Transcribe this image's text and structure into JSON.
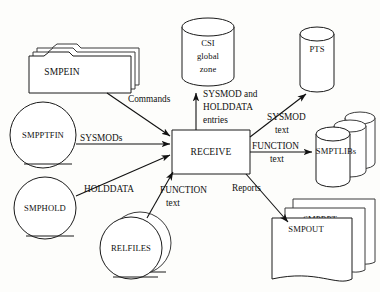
{
  "diagram": {
    "type": "data-flow",
    "process": {
      "id": "receive",
      "label": "RECEIVE",
      "shape": "process-box"
    },
    "inputs": [
      {
        "id": "smpein",
        "label": "SMPEIN",
        "shape": "folder-stack",
        "count": 3
      },
      {
        "id": "smpptfin",
        "label": "SMPPTFIN",
        "shape": "tape-reel",
        "count": 1
      },
      {
        "id": "smphold",
        "label": "SMPHOLD",
        "shape": "tape-reel",
        "count": 1
      },
      {
        "id": "relfiles",
        "label": "RELFILES",
        "shape": "tape-reel",
        "count": 2
      }
    ],
    "outputs": [
      {
        "id": "csi",
        "label_lines": [
          "CSI",
          "global",
          "zone"
        ],
        "shape": "cylinder",
        "count": 1
      },
      {
        "id": "pts",
        "label_lines": [
          "PTS"
        ],
        "shape": "cylinder",
        "count": 1
      },
      {
        "id": "smptlibs",
        "label_lines": [
          "SMPTLIBs"
        ],
        "shape": "cylinder-stack",
        "count": 3
      },
      {
        "id": "reports",
        "label_lines": [
          "SMPRPT",
          "SMPOUT"
        ],
        "shape": "document-stack",
        "count": 3
      }
    ],
    "edges": [
      {
        "id": "e-smpein-receive",
        "from": "smpein",
        "to": "receive",
        "label_lines": [
          "Commands"
        ]
      },
      {
        "id": "e-smpptfin-receive",
        "from": "smpptfin",
        "to": "receive",
        "label_lines": [
          "SYSMODs"
        ]
      },
      {
        "id": "e-smphold-receive",
        "from": "smphold",
        "to": "receive",
        "label_lines": [
          "HOLDDATA"
        ]
      },
      {
        "id": "e-relfiles-receive",
        "from": "relfiles",
        "to": "receive",
        "label_lines": [
          "FUNCTION",
          "text"
        ]
      },
      {
        "id": "e-receive-csi",
        "from": "receive",
        "to": "csi",
        "label_lines": [
          "SYSMOD and",
          "HOLDDATA",
          "entries"
        ]
      },
      {
        "id": "e-receive-pts",
        "from": "receive",
        "to": "pts",
        "label_lines": [
          "SYSMOD",
          "text"
        ]
      },
      {
        "id": "e-receive-smptlibs",
        "from": "receive",
        "to": "smptlibs",
        "label_lines": [
          "FUNCTION",
          "text"
        ]
      },
      {
        "id": "e-receive-reports",
        "from": "receive",
        "to": "reports",
        "label_lines": [
          "Reports"
        ]
      }
    ],
    "labels": {
      "smpein": "SMPEIN",
      "smpptfin": "SMPPTFIN",
      "smphold": "SMPHOLD",
      "relfiles": "RELFILES",
      "receive": "RECEIVE",
      "csi_line1": "CSI",
      "csi_line2": "global",
      "csi_line3": "zone",
      "pts": "PTS",
      "smptlibs": "SMPTLIBs",
      "smprpt": "SMPRPT",
      "smpout": "SMPOUT",
      "edge_commands": "Commands",
      "edge_sysmods": "SYSMODs",
      "edge_holddata": "HOLDDATA",
      "edge_function_in_l1": "FUNCTION",
      "edge_function_in_l2": "text",
      "edge_csi_l1": "SYSMOD and",
      "edge_csi_l2": "HOLDDATA",
      "edge_csi_l3": "entries",
      "edge_pts_l1": "SYSMOD",
      "edge_pts_l2": "text",
      "edge_tlibs_l1": "FUNCTION",
      "edge_tlibs_l2": "text",
      "edge_reports": "Reports"
    },
    "colors": {
      "background": "#fdfdfb",
      "stroke": "#1a1a1a",
      "text": "#111111",
      "fill": "#ffffff"
    }
  }
}
